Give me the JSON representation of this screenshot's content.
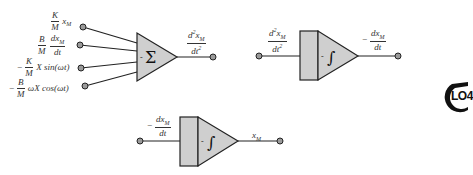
{
  "diagram": {
    "summer": {
      "symbol": "Σ",
      "sign": "-",
      "inputs": [
        {
          "neg": "",
          "num": "K",
          "den": "M",
          "rest": "x",
          "rest_sub": "M"
        },
        {
          "neg": "",
          "num": "B",
          "den": "M",
          "rest_num": "dx",
          "rest_num_sub": "M",
          "rest_den": "dt"
        },
        {
          "neg": "−",
          "num": "K",
          "den": "M",
          "rest": "X sin(ωt)"
        },
        {
          "neg": "−",
          "num": "B",
          "den": "M",
          "rest": "ωX cos(ωt)"
        }
      ],
      "output": {
        "num": "d",
        "num_sup": "2",
        "num_tail": "x",
        "num_sub": "M",
        "den": "dt",
        "den_sup": "2"
      }
    },
    "integrator1": {
      "symbol": "∫",
      "sign": "-",
      "input": {
        "num": "d",
        "num_sup": "2",
        "num_tail": "x",
        "num_sub": "M",
        "den": "dt",
        "den_sup": "2"
      },
      "output": {
        "neg": "−",
        "num": "dx",
        "num_sub": "M",
        "den": "dt"
      }
    },
    "integrator2": {
      "symbol": "∫",
      "sign": "-",
      "input": {
        "neg": "−",
        "num": "dx",
        "num_sub": "M",
        "den": "dt"
      },
      "output": {
        "text": "x",
        "sub": "M"
      }
    },
    "badge": {
      "text": "LO4"
    },
    "colors": {
      "block_fill": "#cfcfcf",
      "stroke": "#222222",
      "dot_fill": "#9a9a9a"
    }
  }
}
